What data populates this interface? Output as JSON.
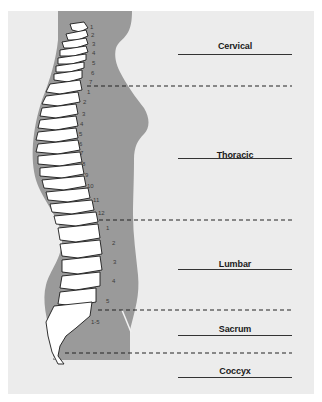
{
  "diagram": {
    "type": "anatomical-spine-lateral-view",
    "colors": {
      "background": "#ececec",
      "silhouette": "#9a9a9a",
      "bone": "#ffffff",
      "bone_outline": "#1a1a1a",
      "label": "#1a1a1a",
      "divider": "#222222"
    },
    "regions": [
      {
        "label": "Cervical",
        "vertebrae": [
          "1",
          "2",
          "3",
          "4",
          "5",
          "6",
          "7"
        ]
      },
      {
        "label": "Thoracic",
        "vertebrae": [
          "1",
          "2",
          "3",
          "4",
          "5",
          "6",
          "7",
          "8",
          "9",
          "10",
          "11",
          "12"
        ]
      },
      {
        "label": "Lumbar",
        "vertebrae": [
          "1",
          "2",
          "3",
          "4",
          "5"
        ]
      },
      {
        "label": "Sacrum",
        "vertebrae": [
          "1-5"
        ]
      },
      {
        "label": "Coccyx",
        "vertebrae": []
      }
    ]
  }
}
